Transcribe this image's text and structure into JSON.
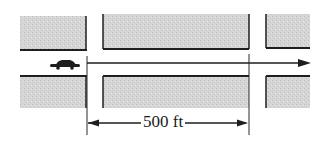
{
  "diagram": {
    "type": "street-intersection-schematic",
    "dimension_label": "500 ft",
    "colors": {
      "block_fill": "#d4d4d4",
      "line": "#1e1e1e",
      "background": "#ffffff"
    },
    "elements": {
      "car": "car-icon",
      "direction_arrow": "arrow-right",
      "dimension": "double-headed-arrow"
    }
  }
}
